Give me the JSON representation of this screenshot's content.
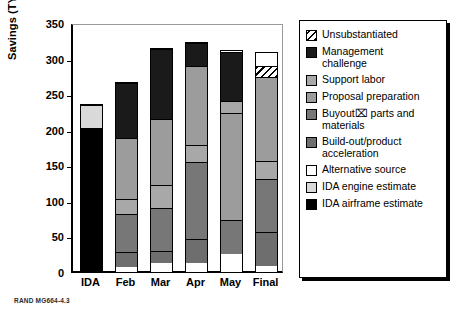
{
  "credit": "RAND MG664-4.3",
  "axis": {
    "ylabel": "Savings (TY $millions)",
    "yticks": [
      "0",
      "50",
      "100",
      "150",
      "200",
      "250",
      "300",
      "350"
    ]
  },
  "legend": {
    "items": [
      {
        "label": "Unsubstantiated",
        "key": "unsubstantiated",
        "swatch": "hatch-diagonal",
        "color": "#000000"
      },
      {
        "label": "Management\nchallenge",
        "key": "management_challenge",
        "swatch": "solid",
        "color": "#1a1a1a"
      },
      {
        "label": "Support labor",
        "key": "support_labor",
        "swatch": "solid",
        "color": "#a8a8a8"
      },
      {
        "label": "Proposal preparation",
        "key": "proposal_preparation",
        "swatch": "solid",
        "color": "#9c9c9c"
      },
      {
        "label": "Buyout⌧ parts and\nmaterials",
        "key": "buyout_parts_materials",
        "swatch": "solid",
        "color": "#777777"
      },
      {
        "label": "Build-out/product\nacceleration",
        "key": "build_out_product_acceleration",
        "swatch": "solid",
        "color": "#6e6e6e"
      },
      {
        "label": "Alternative source",
        "key": "alternative_source",
        "swatch": "solid",
        "color": "#ffffff"
      },
      {
        "label": "IDA engine estimate",
        "key": "ida_engine_estimate",
        "swatch": "solid",
        "color": "#d9d9d9"
      },
      {
        "label": "IDA airframe estimate",
        "key": "ida_airframe_estimate",
        "swatch": "solid",
        "color": "#000000"
      }
    ]
  },
  "chart_data": {
    "type": "bar",
    "title": "",
    "xlabel": "",
    "ylabel": "Savings (TY $millions)",
    "ylim": [
      0,
      350
    ],
    "ytick_step": 50,
    "grid": false,
    "stacked": true,
    "legend_position": "right",
    "categories": [
      "IDA",
      "Feb",
      "Mar",
      "Apr",
      "May",
      "Final"
    ],
    "series": [
      {
        "name": "IDA airframe estimate",
        "values": [
          203,
          0,
          0,
          0,
          0,
          0
        ]
      },
      {
        "name": "IDA engine estimate",
        "values": [
          32,
          0,
          0,
          0,
          0,
          0
        ]
      },
      {
        "name": "Alternative source",
        "values": [
          0,
          7,
          13,
          13,
          26,
          8
        ]
      },
      {
        "name": "Build-out/product acceleration",
        "values": [
          0,
          21,
          17,
          34,
          0,
          48
        ]
      },
      {
        "name": "Buyout parts and materials",
        "values": [
          0,
          54,
          60,
          107,
          47,
          75
        ]
      },
      {
        "name": "Support labor",
        "values": [
          0,
          20,
          33,
          0,
          0,
          25
        ]
      },
      {
        "name": "Proposal preparation",
        "values": [
          0,
          86,
          92,
          110,
          150,
          118
        ]
      },
      {
        "name": "Support labor (upper)",
        "values": [
          0,
          0,
          0,
          25,
          17,
          0
        ]
      },
      {
        "name": "Proposal preparation (upper)",
        "values": [
          0,
          0,
          0,
          0,
          0,
          0
        ]
      },
      {
        "name": "Management challenge",
        "values": [
          0,
          78,
          98,
          33,
          70,
          0
        ]
      },
      {
        "name": "Unsubstantiated",
        "values": [
          0,
          0,
          0,
          0,
          0,
          15
        ]
      }
    ],
    "totals": [
      235,
      266,
      313,
      322,
      310,
      308
    ]
  },
  "bars": [
    {
      "label": "IDA",
      "total": 235,
      "segments": [
        {
          "key": "ida_airframe_estimate",
          "value": 203
        },
        {
          "key": "ida_engine_estimate",
          "value": 32
        }
      ]
    },
    {
      "label": "Feb",
      "total": 266,
      "segments": [
        {
          "key": "alternative_source",
          "value": 7
        },
        {
          "key": "build_out_product_acceleration",
          "value": 21
        },
        {
          "key": "buyout_parts_materials",
          "value": 54
        },
        {
          "key": "support_labor",
          "value": 20
        },
        {
          "key": "proposal_preparation",
          "value": 86
        },
        {
          "key": "management_challenge",
          "value": 78
        }
      ]
    },
    {
      "label": "Mar",
      "total": 313,
      "segments": [
        {
          "key": "alternative_source",
          "value": 13
        },
        {
          "key": "build_out_product_acceleration",
          "value": 17
        },
        {
          "key": "buyout_parts_materials",
          "value": 60
        },
        {
          "key": "support_labor",
          "value": 33
        },
        {
          "key": "proposal_preparation",
          "value": 92
        },
        {
          "key": "management_challenge",
          "value": 98
        }
      ]
    },
    {
      "label": "Apr",
      "total": 322,
      "segments": [
        {
          "key": "alternative_source",
          "value": 13
        },
        {
          "key": "build_out_product_acceleration",
          "value": 34
        },
        {
          "key": "buyout_parts_materials",
          "value": 107
        },
        {
          "key": "support_labor",
          "value": 25
        },
        {
          "key": "proposal_preparation",
          "value": 110
        },
        {
          "key": "management_challenge",
          "value": 33
        }
      ]
    },
    {
      "label": "May",
      "total": 310,
      "segments": [
        {
          "key": "alternative_source",
          "value": 26
        },
        {
          "key": "buyout_parts_materials",
          "value": 47
        },
        {
          "key": "proposal_preparation",
          "value": 150
        },
        {
          "key": "support_labor",
          "value": 17
        },
        {
          "key": "management_challenge",
          "value": 70
        }
      ]
    },
    {
      "label": "Final",
      "total": 308,
      "segments": [
        {
          "key": "alternative_source",
          "value": 8
        },
        {
          "key": "build_out_product_acceleration",
          "value": 48
        },
        {
          "key": "buyout_parts_materials",
          "value": 75
        },
        {
          "key": "support_labor",
          "value": 25
        },
        {
          "key": "proposal_preparation",
          "value": 118
        },
        {
          "key": "unsubstantiated",
          "value": 15
        }
      ]
    }
  ]
}
